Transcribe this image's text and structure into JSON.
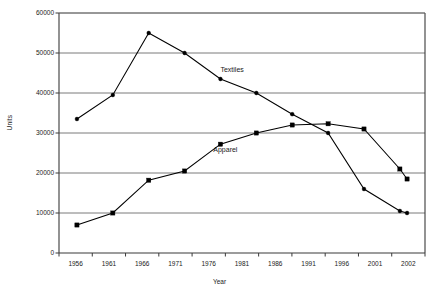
{
  "chart_data": {
    "type": "line",
    "title": "",
    "xlabel": "Year",
    "ylabel": "Units",
    "grid": true,
    "legend_position": "inline-annotation",
    "x": [
      1956,
      1961,
      1966,
      1971,
      1976,
      1981,
      1986,
      1991,
      1996,
      2001,
      2002
    ],
    "categories": [
      "1956",
      "1961",
      "1966",
      "1971",
      "1976",
      "1981",
      "1986",
      "1991",
      "1996",
      "2001",
      "2002"
    ],
    "xlim": [
      1953.5,
      2004.5
    ],
    "ylim": [
      0,
      60000
    ],
    "ytick_labels": [
      "0",
      "10000",
      "20000",
      "30000",
      "40000",
      "50000",
      "60000"
    ],
    "ytick_values": [
      0,
      10000,
      20000,
      30000,
      40000,
      50000,
      60000
    ],
    "series": [
      {
        "name": "Textiles",
        "marker": "circle",
        "color": "#000000",
        "values": [
          33500,
          39500,
          55000,
          50000,
          43500,
          40000,
          34700,
          30000,
          16000,
          10500,
          10000
        ]
      },
      {
        "name": "Apparel",
        "marker": "square",
        "color": "#000000",
        "values": [
          7000,
          10000,
          18200,
          20500,
          27200,
          30000,
          32000,
          32300,
          31000,
          21000,
          18500
        ]
      }
    ],
    "annotations": [
      {
        "text": "Textiles",
        "x": 1976,
        "y": 45500
      },
      {
        "text": "Apparel",
        "x": 1975,
        "y": 25500
      }
    ]
  },
  "axes": {
    "y_title": "Units",
    "x_title": "Year"
  }
}
